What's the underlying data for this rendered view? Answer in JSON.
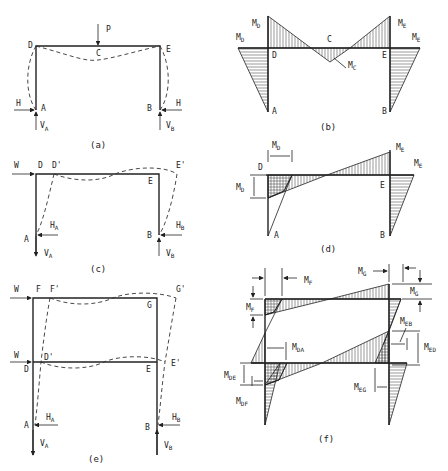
{
  "figure": {
    "panels": [
      {
        "id": "a",
        "caption": "(a)",
        "labels": {
          "D": "D",
          "C": "C",
          "E": "E",
          "A": "A",
          "B": "B",
          "P": "P",
          "H_left": "H",
          "H_right": "H",
          "VA": "V",
          "VA_sub": "A",
          "VB": "V",
          "VB_sub": "B"
        }
      },
      {
        "id": "b",
        "caption": "(b)",
        "labels": {
          "MD_top": "M",
          "MD_top_sub": "D",
          "MD_left": "M",
          "MD_left_sub": "D",
          "ME_top": "M",
          "ME_top_sub": "E",
          "ME_right": "M",
          "ME_right_sub": "E",
          "C": "C",
          "D": "D",
          "E": "E",
          "MC": "M",
          "MC_sub": "C",
          "A": "A",
          "B": "B"
        }
      },
      {
        "id": "c",
        "caption": "(c)",
        "labels": {
          "W": "W",
          "D": "D",
          "Dp": "D'",
          "Ep": "E'",
          "E": "E",
          "HA": "H",
          "HA_sub": "A",
          "HB": "H",
          "HB_sub": "B",
          "A": "A",
          "B": "B",
          "VA": "V",
          "VA_sub": "A",
          "VB": "V",
          "VB_sub": "B"
        }
      },
      {
        "id": "d",
        "caption": "(d)",
        "labels": {
          "MD_h": "M",
          "MD_h_sub": "D",
          "MD_v": "M",
          "MD_v_sub": "D",
          "ME_top": "M",
          "ME_top_sub": "E",
          "ME_right": "M",
          "ME_right_sub": "E",
          "D": "D",
          "E": "E",
          "A": "A",
          "B": "B"
        }
      },
      {
        "id": "e",
        "caption": "(e)",
        "labels": {
          "W_top": "W",
          "F": "F",
          "Fp": "F'",
          "Gp": "G'",
          "G": "G",
          "W_mid": "W",
          "D": "D",
          "Dp": "D'",
          "E": "E",
          "Ep": "E'",
          "HA": "H",
          "HA_sub": "A",
          "HB": "H",
          "HB_sub": "B",
          "A": "A",
          "B": "B",
          "VA": "V",
          "VA_sub": "A",
          "VB": "V",
          "VB_sub": "B"
        }
      },
      {
        "id": "f",
        "caption": "(f)",
        "labels": {
          "MF_h": "M",
          "MF_h_sub": "F",
          "MF_v": "M",
          "MF_v_sub": "F",
          "MG_h": "M",
          "MG_h_sub": "G",
          "MG_v": "M",
          "MG_v_sub": "G",
          "MEB": "M",
          "MEB_sub": "EB",
          "MDA": "M",
          "MDA_sub": "DA",
          "MED": "M",
          "MED_sub": "ED",
          "MDE": "M",
          "MDE_sub": "DE",
          "MDF": "M",
          "MDF_sub": "DF",
          "MEG": "M",
          "MEG_sub": "EG"
        }
      }
    ]
  }
}
